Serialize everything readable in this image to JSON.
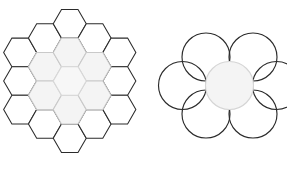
{
  "figure": {
    "background_color": "#ffffff",
    "width": 287,
    "height": 171,
    "panels": [
      {
        "id": "hexagon-grid",
        "label": "Hexagonal tiling cluster",
        "shape_type": "hexagon",
        "orientation": "flat-top",
        "total_cells": 19,
        "columns": [
          3,
          4,
          5,
          4,
          3
        ],
        "bounds": {
          "x": 8,
          "y": 5,
          "width": 140,
          "height": 157
        },
        "geometry": {
          "cell_radius": 16.5,
          "center_x": 78,
          "center_y": 83,
          "col_step": 24.8,
          "row_step": 28.6
        },
        "stroke_outer": "#2b2b2b",
        "stroke_inner": "#c9c9c9",
        "stroke_center": "#d8d8d8",
        "fill_outer": "#ffffff",
        "fill_inner": "#f4f4f4",
        "fill_center": "#f7f7f7",
        "highlighted_cells": 7,
        "highlight_description": "central cell plus its six neighbors drawn in light grey"
      },
      {
        "id": "circle-cluster",
        "label": "Circle packing cluster",
        "shape_type": "circle",
        "total_cells": 7,
        "arrangement": "one center with six surrounding",
        "bounds": {
          "x": 183,
          "y": 28,
          "width": 93,
          "height": 115
        },
        "geometry": {
          "radius": 24.0,
          "center_x": 229.5,
          "center_y": 85.5,
          "ring_offset_x": 23.5,
          "ring_offset_y": 28.5
        },
        "stroke_outer": "#2b2b2b",
        "stroke_center": "#d5d5d5",
        "fill_outer": "#ffffff",
        "fill_center": "#f4f4f4",
        "highlighted_cells": 1,
        "highlight_description": "central circle drawn in light grey with pale fill"
      }
    ],
    "hexagon_cells": [
      {
        "col": -2,
        "row": -1,
        "group": "outer"
      },
      {
        "col": -2,
        "row": 0,
        "group": "outer"
      },
      {
        "col": -2,
        "row": 1,
        "group": "outer"
      },
      {
        "col": -1,
        "row": -1.5,
        "group": "outer"
      },
      {
        "col": -1,
        "row": -0.5,
        "group": "inner"
      },
      {
        "col": -1,
        "row": 0.5,
        "group": "inner"
      },
      {
        "col": -1,
        "row": 1.5,
        "group": "outer"
      },
      {
        "col": 0,
        "row": -2,
        "group": "outer"
      },
      {
        "col": 0,
        "row": -1,
        "group": "inner"
      },
      {
        "col": 0,
        "row": 0,
        "group": "center"
      },
      {
        "col": 0,
        "row": 1,
        "group": "inner"
      },
      {
        "col": 0,
        "row": 2,
        "group": "outer"
      },
      {
        "col": 1,
        "row": -1.5,
        "group": "outer"
      },
      {
        "col": 1,
        "row": -0.5,
        "group": "inner"
      },
      {
        "col": 1,
        "row": 0.5,
        "group": "inner"
      },
      {
        "col": 1,
        "row": 1.5,
        "group": "outer"
      },
      {
        "col": 2,
        "row": -1,
        "group": "outer"
      },
      {
        "col": 2,
        "row": 0,
        "group": "outer"
      },
      {
        "col": 2,
        "row": 1,
        "group": "outer"
      }
    ],
    "circle_cells": [
      {
        "angle_deg": null,
        "group": "center"
      },
      {
        "angle_deg": 240,
        "group": "outer"
      },
      {
        "angle_deg": 300,
        "group": "outer"
      },
      {
        "angle_deg": 0,
        "group": "outer"
      },
      {
        "angle_deg": 60,
        "group": "outer"
      },
      {
        "angle_deg": 120,
        "group": "outer"
      },
      {
        "angle_deg": 180,
        "group": "outer"
      }
    ]
  }
}
